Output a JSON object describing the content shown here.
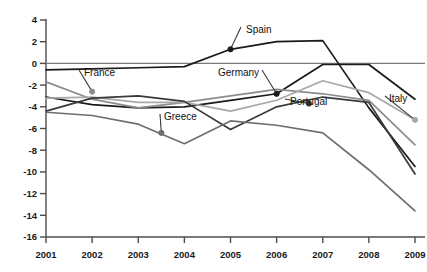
{
  "chart_data": {
    "type": "line",
    "title": "",
    "xlabel": "",
    "ylabel": "",
    "x": [
      2001,
      2002,
      2003,
      2004,
      2005,
      2006,
      2007,
      2008,
      2009
    ],
    "xticklabels": [
      "2001",
      "2002",
      "2003",
      "2004",
      "2005",
      "2006",
      "2007",
      "2008",
      "2009"
    ],
    "yticks": [
      4,
      2,
      0,
      -2,
      -4,
      -6,
      -8,
      -10,
      -12,
      -14,
      -16
    ],
    "yticklabels": [
      "4",
      "2",
      "0",
      "-2",
      "-4",
      "-6",
      "-8",
      "-10",
      "-12",
      "-14",
      "-16"
    ],
    "ylim": [
      -16,
      4
    ],
    "xlim": [
      2001,
      2009
    ],
    "grid": false,
    "legend": "annotated-inline",
    "zero_line": 0,
    "series": [
      {
        "name": "Spain",
        "color": "#1a1a1a",
        "values": [
          -0.6,
          -0.5,
          -0.4,
          -0.3,
          1.3,
          2.0,
          2.1,
          -4.1,
          -9.5
        ],
        "label_x": 2005,
        "label_y": 1.3
      },
      {
        "name": "Germany",
        "color": "#1a1a1a",
        "values": [
          -3.1,
          -3.8,
          -4.1,
          -4.0,
          -3.4,
          -2.8,
          -0.1,
          -0.1,
          -3.3
        ],
        "label_x": 2006,
        "label_y": -2.8
      },
      {
        "name": "France",
        "color": "#8c8c8c",
        "values": [
          -1.7,
          -3.3,
          -4.1,
          -3.6,
          -3.0,
          -2.4,
          -2.8,
          -3.4,
          -7.5
        ],
        "label_x": 2002,
        "label_y": -2.6
      },
      {
        "name": "Italy",
        "color": "#a8a8a8",
        "values": [
          -3.2,
          -3.1,
          -3.6,
          -3.6,
          -4.4,
          -3.4,
          -1.6,
          -2.7,
          -5.2
        ],
        "label_x": 2009,
        "label_y": -5.2
      },
      {
        "name": "Portugal",
        "color": "#3a3a3a",
        "values": [
          -4.4,
          -3.2,
          -3.0,
          -3.5,
          -6.1,
          -4.0,
          -3.1,
          -3.6,
          -10.2
        ],
        "label_x": 2006.7,
        "label_y": -3.7
      },
      {
        "name": "Greece",
        "color": "#6e6e6e",
        "values": [
          -4.5,
          -4.8,
          -5.6,
          -7.4,
          -5.3,
          -5.7,
          -6.4,
          -9.8,
          -13.6
        ],
        "label_x": 2003.5,
        "label_y": -6.4
      }
    ]
  },
  "axis": {
    "axis_color": "#4d4d4d",
    "zero_line_color": "#7a7a7a"
  }
}
